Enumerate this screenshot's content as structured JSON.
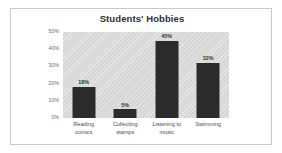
{
  "chart_data": {
    "type": "bar",
    "title": "Students' Hobbies",
    "categories": [
      "Reading comics",
      "Collecting stamps",
      "Listening to music",
      "Swimming"
    ],
    "values": [
      18,
      45,
      5,
      32
    ],
    "value_labels": [
      "18%",
      "5%",
      "45%",
      "32%"
    ],
    "xlabel": "",
    "ylabel": "",
    "ylim": [
      0,
      50
    ],
    "ytick_labels": [
      "50%",
      "40%",
      "30%",
      "20%",
      "10%",
      "0%"
    ],
    "ytick_values": [
      50,
      40,
      30,
      20,
      10,
      0
    ],
    "grid": false,
    "legend": false,
    "bar_color": "#2b2b2b",
    "plot_background": "#d6d6d6",
    "frame_border_color": "#c9c9c9"
  },
  "series_points": [
    {
      "category": "Reading comics",
      "label_line1": "Reading",
      "label_line2": "comics",
      "value": 18,
      "value_label": "18%"
    },
    {
      "category": "Collecting stamps",
      "label_line1": "Collecting",
      "label_line2": "stamps",
      "value": 5,
      "value_label": "5%"
    },
    {
      "category": "Listening to music",
      "label_line1": "Listening to",
      "label_line2": "music",
      "value": 45,
      "value_label": "45%"
    },
    {
      "category": "Swimming",
      "label_line1": "Swimming",
      "label_line2": "",
      "value": 32,
      "value_label": "32%"
    }
  ]
}
